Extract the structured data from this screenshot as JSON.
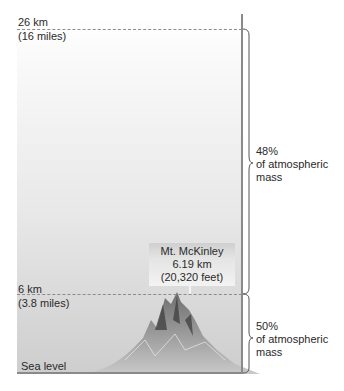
{
  "diagram": {
    "top_altitude": {
      "km": "26 km",
      "miles": "(16 miles)"
    },
    "mid_altitude": {
      "km": "6 km",
      "miles": "(3.8 miles)"
    },
    "base_label": "Sea level",
    "upper_layer": {
      "percent": "48%",
      "line2": "of atmospheric",
      "line3": "mass"
    },
    "lower_layer": {
      "percent": "50%",
      "line2": "of atmospheric",
      "line3": "mass"
    },
    "peak_callout": {
      "name": "Mt. McKinley",
      "height_km": "6.19 km",
      "height_feet": "(20,320 feet)"
    },
    "colors": {
      "dash": "#8c8c8c",
      "edge": "#8a8a8a",
      "text": "#2a2a2a"
    }
  }
}
